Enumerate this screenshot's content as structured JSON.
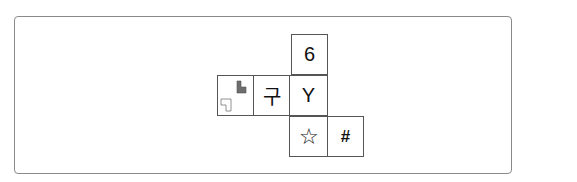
{
  "diagram": {
    "type": "cube-net",
    "faces": [
      {
        "id": "top",
        "label": "6",
        "row": 0,
        "col": 2
      },
      {
        "id": "left-pattern",
        "label": "",
        "row": 1,
        "col": 0,
        "content": "two L-shapes: grey filled (top-right), white outlined (bottom-left)"
      },
      {
        "id": "left",
        "label": "구",
        "row": 1,
        "col": 1
      },
      {
        "id": "center",
        "label": "Y",
        "row": 1,
        "col": 2
      },
      {
        "id": "bottom",
        "label": "☆",
        "row": 2,
        "col": 2
      },
      {
        "id": "bottom-right",
        "label": "#",
        "row": 2,
        "col": 3
      }
    ],
    "colors": {
      "border": "#555555",
      "frame": "#8a8a8a",
      "shape_fill": "#6e6e6e"
    }
  }
}
